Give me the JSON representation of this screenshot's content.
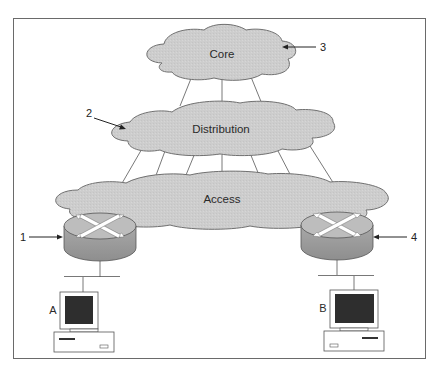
{
  "diagram": {
    "type": "hierarchical-network-model",
    "layers": [
      {
        "id": "core",
        "label": "Core",
        "callout": "3"
      },
      {
        "id": "distribution",
        "label": "Distribution",
        "callout": "2"
      },
      {
        "id": "access",
        "label": "Access"
      }
    ],
    "routers": [
      {
        "id": "router-left",
        "callout": "1"
      },
      {
        "id": "router-right",
        "callout": "4"
      }
    ],
    "hosts": [
      {
        "id": "host-a",
        "label": "A"
      },
      {
        "id": "host-b",
        "label": "B"
      }
    ],
    "connections": {
      "core_to_distribution": 3,
      "distribution_to_access": 7
    },
    "colors": {
      "cloud_fill": "#cfcfcf",
      "cloud_stroke": "#7a7a7a",
      "router_top": "#bdbdbd",
      "router_side": "#9a9a9a",
      "screen": "#2e2e2e",
      "frame": "#6a6a6a"
    }
  }
}
